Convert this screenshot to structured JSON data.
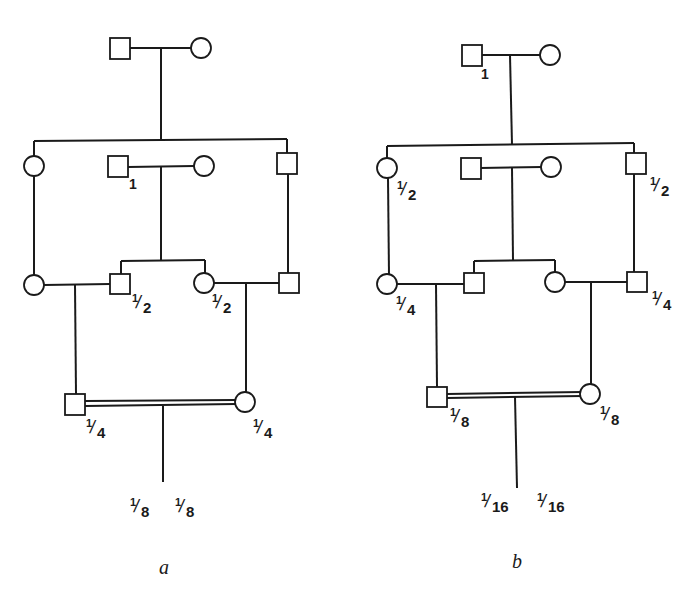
{
  "diagram": {
    "type": "pedigree",
    "panels": [
      {
        "id": "a",
        "caption": "a",
        "marked_ancestor": "second-generation male (married-in couple, center)",
        "labels": {
          "ancestor": "1",
          "gen3_male_center": "1/2",
          "gen3_female_center": "1/2",
          "gen4_male": "1/4",
          "gen4_female": "1/4",
          "offspring_left": "1/8",
          "offspring_right": "1/8"
        }
      },
      {
        "id": "b",
        "caption": "b",
        "marked_ancestor": "first-generation male (top couple)",
        "labels": {
          "ancestor": "1",
          "gen2_female_left": "1/2",
          "gen2_male_right": "1/2",
          "gen3_female_left": "1/4",
          "gen3_male_right": "1/4",
          "gen4_male": "1/8",
          "gen4_female": "1/8",
          "offspring_left": "1/16",
          "offspring_right": "1/16"
        }
      }
    ]
  },
  "text": {
    "a": {
      "one": "1",
      "g3m_n": "1",
      "g3m_d": "2",
      "g3f_n": "1",
      "g3f_d": "2",
      "g4m_n": "1",
      "g4m_d": "4",
      "g4f_n": "1",
      "g4f_d": "4",
      "offL_n": "1",
      "offL_d": "8",
      "offR_n": "1",
      "offR_d": "8",
      "caption": "a"
    },
    "b": {
      "one": "1",
      "g2f_n": "1",
      "g2f_d": "2",
      "g2m_n": "1",
      "g2m_d": "2",
      "g3f_n": "1",
      "g3f_d": "4",
      "g3m_n": "1",
      "g3m_d": "4",
      "g4m_n": "1",
      "g4m_d": "8",
      "g4f_n": "1",
      "g4f_d": "8",
      "offL_n": "1",
      "offL_d": "16",
      "offR_n": "1",
      "offR_d": "16",
      "caption": "b"
    },
    "slash": "/"
  }
}
